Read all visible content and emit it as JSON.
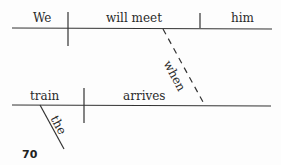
{
  "diagram": {
    "type": "sentence-diagram",
    "main_clause": {
      "subject": "We",
      "verb": "will meet",
      "object": "him"
    },
    "connector": "when",
    "subordinate_clause": {
      "subject": "train",
      "modifier": "the",
      "verb": "arrives"
    }
  },
  "page_number": "70"
}
